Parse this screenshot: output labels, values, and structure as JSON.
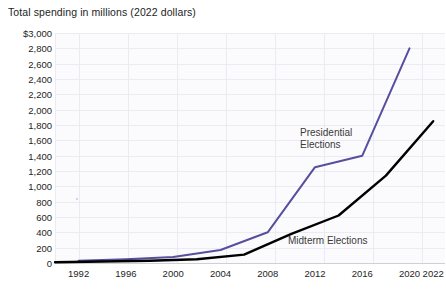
{
  "chart_data": {
    "type": "line",
    "title": "Total spending in millions (2022 dollars)",
    "xlabel": "",
    "ylabel": "",
    "ylim": [
      0,
      3000
    ],
    "yticks": [
      "$3,000",
      "2,800",
      "2,600",
      "2,400",
      "2,200",
      "2,000",
      "1,800",
      "1,600",
      "1,400",
      "1,200",
      "1,000",
      "800",
      "600",
      "400",
      "200",
      "0"
    ],
    "ytick_values": [
      3000,
      2800,
      2600,
      2400,
      2200,
      2000,
      1800,
      1600,
      1400,
      1200,
      1000,
      800,
      600,
      400,
      200,
      0
    ],
    "xticks": [
      "1992",
      "1996",
      "2000",
      "2004",
      "2008",
      "2012",
      "2016",
      "2020",
      "2022"
    ],
    "xtick_values": [
      1992,
      1996,
      2000,
      2004,
      2008,
      2012,
      2016,
      2020,
      2022
    ],
    "xlim": [
      1990,
      2023
    ],
    "grid": true,
    "legend_position": "inline-annotations",
    "series": [
      {
        "name": "Presidential Elections",
        "color": "#564f9e",
        "label_text": "Presidential\nElections",
        "x": [
          1992,
          1996,
          2000,
          2004,
          2008,
          2012,
          2016,
          2020
        ],
        "values": [
          30,
          50,
          80,
          170,
          400,
          1250,
          1400,
          2800
        ]
      },
      {
        "name": "Midterm Elections",
        "color": "#000000",
        "label_text": "Midterm Elections",
        "x": [
          1990,
          1994,
          1998,
          2002,
          2006,
          2010,
          2014,
          2018,
          2022
        ],
        "values": [
          10,
          20,
          30,
          50,
          110,
          380,
          620,
          1140,
          1850
        ]
      }
    ]
  }
}
